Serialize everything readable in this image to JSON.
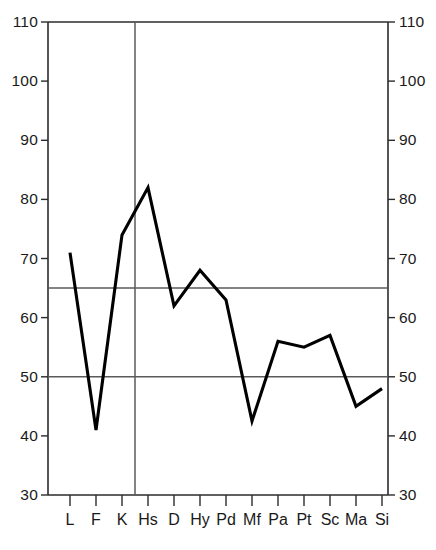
{
  "chart_data": {
    "type": "line",
    "title": "",
    "subtitle": "",
    "xlabel": "",
    "ylabel": "",
    "categories": [
      "L",
      "F",
      "K",
      "Hs",
      "D",
      "Hy",
      "Pd",
      "Mf",
      "Pa",
      "Pt",
      "Sc",
      "Ma",
      "Si"
    ],
    "values": [
      71,
      41,
      74,
      82,
      62,
      68,
      63,
      42.5,
      56,
      55,
      57,
      45,
      48
    ],
    "series": [
      {
        "name": "MMPI profile",
        "values": [
          71,
          41,
          74,
          82,
          62,
          68,
          63,
          42.5,
          56,
          55,
          57,
          45,
          48
        ]
      }
    ],
    "ylim": [
      30,
      110
    ],
    "y_ticks": [
      30,
      40,
      50,
      60,
      70,
      80,
      90,
      100,
      110
    ],
    "y_tick_labels": [
      "30",
      "40",
      "50",
      "60",
      "70",
      "80",
      "90",
      "100",
      "110"
    ],
    "grid": false,
    "legend": "none",
    "dual_y_axis": true,
    "reference_lines": [
      {
        "name": "upper-reference-line",
        "value": 65,
        "orientation": "horizontal",
        "color": "#5a5a5a"
      },
      {
        "name": "lower-reference-line",
        "value": 50,
        "orientation": "horizontal",
        "color": "#5a5a5a"
      }
    ],
    "section_divider": {
      "name": "validity-clinical-divider",
      "after_category": "K",
      "orientation": "vertical",
      "color": "#5a5a5a"
    },
    "line_color": "#000000",
    "background_color": "#ffffff",
    "axis_color": "#2b2b2b"
  },
  "axis": {
    "left_tick_labels": [
      "110",
      "100",
      "90",
      "80",
      "70",
      "60",
      "50",
      "40",
      "30"
    ],
    "right_tick_labels": [
      "110",
      "100",
      "90",
      "80",
      "70",
      "60",
      "50",
      "40",
      "30"
    ],
    "category_labels": [
      "L",
      "F",
      "K",
      "Hs",
      "D",
      "Hy",
      "Pd",
      "Mf",
      "Pa",
      "Pt",
      "Sc",
      "Ma",
      "Si"
    ]
  },
  "caption": {
    "text": ""
  }
}
